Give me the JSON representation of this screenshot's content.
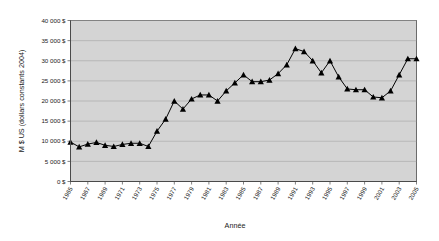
{
  "chart_data": {
    "type": "line",
    "title": "",
    "xlabel": "Année",
    "ylabel": "M $ US (dollars constants 2004)",
    "xlim": [
      1965,
      2005
    ],
    "ylim": [
      0,
      40000
    ],
    "grid": true,
    "legend_position": "none",
    "marker": "triangle",
    "y_ticks": [
      0,
      5000,
      10000,
      15000,
      20000,
      25000,
      30000,
      35000,
      40000
    ],
    "y_tick_labels": [
      "0 $",
      "5 000 $",
      "10 000 $",
      "15 000 $",
      "20 000 $",
      "25 000 $",
      "30 000 $",
      "35 000 $",
      "40 000 $"
    ],
    "x_tick_labels": [
      "1965",
      "1967",
      "1969",
      "1971",
      "1973",
      "1975",
      "1977",
      "1979",
      "1981",
      "1983",
      "1985",
      "1987",
      "1989",
      "1991",
      "1993",
      "1995",
      "1997",
      "1999",
      "2001",
      "2003",
      "2005"
    ],
    "x": [
      1965,
      1966,
      1967,
      1968,
      1969,
      1970,
      1971,
      1972,
      1973,
      1974,
      1975,
      1976,
      1977,
      1978,
      1979,
      1980,
      1981,
      1982,
      1983,
      1984,
      1985,
      1986,
      1987,
      1988,
      1989,
      1990,
      1991,
      1992,
      1993,
      1994,
      1995,
      1996,
      1997,
      1998,
      1999,
      2000,
      2001,
      2002,
      2003,
      2004,
      2005
    ],
    "values": [
      9800,
      8600,
      9300,
      9700,
      9000,
      8700,
      9200,
      9500,
      9500,
      8700,
      12500,
      15500,
      20000,
      18000,
      20500,
      21500,
      21500,
      20000,
      22500,
      24500,
      26500,
      24800,
      24800,
      25200,
      26800,
      29000,
      33000,
      32300,
      30000,
      27000,
      30000,
      26000,
      23000,
      22800,
      22800,
      21000,
      20800,
      22500,
      26500,
      30500,
      30500
    ],
    "series_name": "M $ US (dollars constants 2004)",
    "colors": {
      "plot_background": "#d4d4d4",
      "page_background": "#ffffff",
      "line": "#000000",
      "marker": "#000000",
      "gridline": "#9a9a9a",
      "axis": "#4a4a4a",
      "text": "#1a1a1a"
    }
  }
}
